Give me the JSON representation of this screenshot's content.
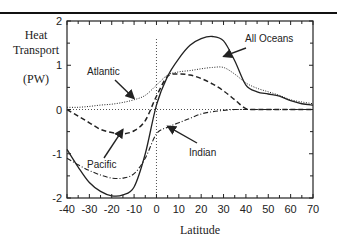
{
  "chart_data": {
    "type": "line",
    "title": "",
    "xlabel": "Latitude",
    "ylabel": "Heat Transport",
    "yunits": "(PW)",
    "xlim": [
      -40,
      70
    ],
    "ylim": [
      -2,
      2
    ],
    "x_ticks": [
      -40,
      -30,
      -20,
      -10,
      0,
      10,
      20,
      30,
      40,
      50,
      60,
      70
    ],
    "y_ticks": [
      -2,
      -1,
      0,
      1,
      2
    ],
    "grid": false,
    "reference_lines": {
      "horizontal_y": 0,
      "vertical_x": 0,
      "style": "dotted"
    },
    "x": [
      -40,
      -35,
      -30,
      -25,
      -20,
      -15,
      -10,
      -5,
      0,
      5,
      10,
      15,
      20,
      25,
      30,
      35,
      40,
      45,
      50,
      55,
      60,
      65,
      70
    ],
    "series": [
      {
        "name": "All Oceans",
        "style": "solid",
        "values": [
          -0.9,
          -1.3,
          -1.65,
          -1.85,
          -1.95,
          -1.93,
          -1.75,
          -1.0,
          0.1,
          0.75,
          1.15,
          1.45,
          1.6,
          1.65,
          1.55,
          1.1,
          0.55,
          0.4,
          0.35,
          0.3,
          0.2,
          0.13,
          0.1
        ]
      },
      {
        "name": "Atlantic",
        "style": "dotted",
        "values": [
          0.05,
          0.05,
          0.07,
          0.1,
          0.12,
          0.16,
          0.22,
          0.32,
          0.55,
          0.78,
          0.85,
          0.88,
          0.92,
          0.95,
          0.95,
          0.8,
          0.6,
          0.48,
          0.4,
          0.32,
          0.22,
          0.17,
          0.13
        ]
      },
      {
        "name": "Pacific",
        "style": "dashed",
        "values": [
          0.0,
          -0.15,
          -0.3,
          -0.45,
          -0.52,
          -0.55,
          -0.48,
          -0.25,
          0.3,
          0.75,
          0.8,
          0.78,
          0.7,
          0.58,
          0.42,
          0.22,
          0.02,
          0.0,
          0.0,
          0.0,
          0.0,
          0.0,
          0.0
        ]
      },
      {
        "name": "Indian",
        "style": "dash-dot",
        "values": [
          -1.1,
          -1.25,
          -1.38,
          -1.48,
          -1.55,
          -1.55,
          -1.45,
          -1.1,
          -0.55,
          -0.4,
          -0.3,
          -0.2,
          -0.1,
          -0.05,
          -0.02,
          0.0,
          0.0,
          0.0,
          0.0,
          0.0,
          0.0,
          0.0,
          0.0
        ]
      }
    ],
    "annotations": [
      {
        "text": "All Oceans",
        "arrow_to": [
          30,
          1.2
        ]
      },
      {
        "text": "Atlantic",
        "arrow_to": [
          -10,
          0.25
        ]
      },
      {
        "text": "Pacific",
        "arrow_to": [
          -15,
          -0.45
        ]
      },
      {
        "text": "Indian",
        "arrow_to": [
          5,
          -0.38
        ]
      }
    ],
    "legend": "none (inline arrow annotations)"
  },
  "labels": {
    "ylabel_line1": "Heat",
    "ylabel_line2": "Transport",
    "yunits": "(PW)",
    "xlabel": "Latitude",
    "ann_all": "All Oceans",
    "ann_atlantic": "Atlantic",
    "ann_pacific": "Pacific",
    "ann_indian": "Indian"
  },
  "colors": {
    "ink": "#222222",
    "background": "#ffffff"
  }
}
